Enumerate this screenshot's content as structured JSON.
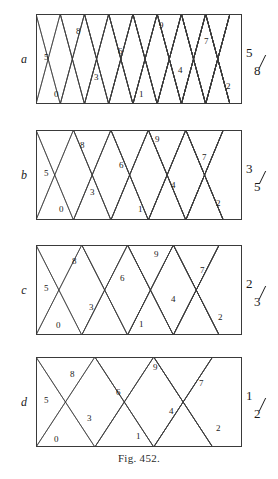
{
  "figure": {
    "caption": "Fig. 452.",
    "caption_top": 452,
    "width": 278,
    "height": 479
  },
  "chart_data": {
    "type": "diagram",
    "title": "Fig. 452.",
    "panel_geometry": {
      "left": 36,
      "width": 206,
      "height": 90
    },
    "cell_labels": [
      "0",
      "1",
      "2",
      "3",
      "4",
      "5",
      "6",
      "7",
      "8",
      "9"
    ],
    "panels": [
      {
        "letter": "a",
        "fraction_numerator": "5",
        "fraction_denominator": "8",
        "slope_ratio": 0.625,
        "top": 14,
        "bounces": 8,
        "labels": [
          {
            "text": "5",
            "x": 8,
            "y": 46
          },
          {
            "text": "0",
            "x": 18,
            "y": 83
          },
          {
            "text": "8",
            "x": 40,
            "y": 20
          },
          {
            "text": "3",
            "x": 58,
            "y": 66
          },
          {
            "text": "6",
            "x": 82,
            "y": 40
          },
          {
            "text": "1",
            "x": 103,
            "y": 83
          },
          {
            "text": "9",
            "x": 123,
            "y": 14
          },
          {
            "text": "4",
            "x": 142,
            "y": 59
          },
          {
            "text": "7",
            "x": 168,
            "y": 30
          },
          {
            "text": "2",
            "x": 190,
            "y": 75
          }
        ]
      },
      {
        "letter": "b",
        "fraction_numerator": "3",
        "fraction_denominator": "5",
        "slope_ratio": 0.6,
        "top": 130,
        "bounces": 5,
        "labels": [
          {
            "text": "5",
            "x": 8,
            "y": 46
          },
          {
            "text": "0",
            "x": 23,
            "y": 82
          },
          {
            "text": "8",
            "x": 44,
            "y": 18
          },
          {
            "text": "3",
            "x": 54,
            "y": 65
          },
          {
            "text": "6",
            "x": 83,
            "y": 38
          },
          {
            "text": "1",
            "x": 102,
            "y": 82
          },
          {
            "text": "9",
            "x": 119,
            "y": 12
          },
          {
            "text": "4",
            "x": 135,
            "y": 58
          },
          {
            "text": "7",
            "x": 166,
            "y": 30
          },
          {
            "text": "2",
            "x": 180,
            "y": 76
          }
        ]
      },
      {
        "letter": "c",
        "fraction_numerator": "2",
        "fraction_denominator": "3",
        "slope_ratio": 0.6667,
        "top": 245,
        "bounces": 4,
        "labels": [
          {
            "text": "5",
            "x": 8,
            "y": 46
          },
          {
            "text": "0",
            "x": 20,
            "y": 83
          },
          {
            "text": "8",
            "x": 36,
            "y": 19
          },
          {
            "text": "3",
            "x": 53,
            "y": 65
          },
          {
            "text": "6",
            "x": 84,
            "y": 36
          },
          {
            "text": "1",
            "x": 103,
            "y": 82
          },
          {
            "text": "9",
            "x": 118,
            "y": 12
          },
          {
            "text": "4",
            "x": 135,
            "y": 57
          },
          {
            "text": "7",
            "x": 164,
            "y": 28
          },
          {
            "text": "2",
            "x": 182,
            "y": 75
          }
        ]
      },
      {
        "letter": "d",
        "fraction_numerator": "1",
        "fraction_denominator": "2",
        "slope_ratio": 0.5,
        "top": 357,
        "bounces": 3,
        "labels": [
          {
            "text": "5",
            "x": 8,
            "y": 46
          },
          {
            "text": "0",
            "x": 18,
            "y": 85
          },
          {
            "text": "8",
            "x": 34,
            "y": 20
          },
          {
            "text": "3",
            "x": 51,
            "y": 64
          },
          {
            "text": "6",
            "x": 80,
            "y": 38
          },
          {
            "text": "1",
            "x": 100,
            "y": 82
          },
          {
            "text": "9",
            "x": 117,
            "y": 13
          },
          {
            "text": "4",
            "x": 133,
            "y": 57
          },
          {
            "text": "7",
            "x": 163,
            "y": 29
          },
          {
            "text": "2",
            "x": 180,
            "y": 74
          }
        ]
      }
    ],
    "colors": {
      "stroke": "#3a3a3a",
      "background": "#ffffff",
      "text": "#1a1a1a"
    }
  }
}
